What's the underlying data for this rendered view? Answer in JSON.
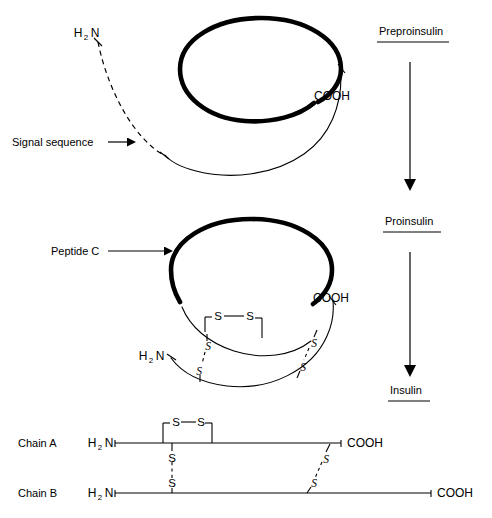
{
  "figure": {
    "background_color": "#ffffff",
    "line_color": "#000000",
    "width": 492,
    "height": 518
  },
  "stages": [
    {
      "id": "preproinsulin",
      "label": "Preproinsulin"
    },
    {
      "id": "proinsulin",
      "label": "Proinsulin"
    },
    {
      "id": "insulin",
      "label": "Insulin"
    }
  ],
  "panel_preproinsulin": {
    "amino_terminus": {
      "text": "H",
      "subscript": "2",
      "text2": "N"
    },
    "carboxyl_terminus": "COOH",
    "callout": "Signal sequence"
  },
  "panel_proinsulin": {
    "amino_terminus": {
      "text": "H",
      "subscript": "2",
      "text2": "N"
    },
    "carboxyl_terminus": "COOH",
    "callout": "Peptide C",
    "disulfide_label": "S",
    "disulfide_bridges": [
      {
        "id": "intra-a-chain",
        "atoms": [
          "S",
          "S"
        ]
      },
      {
        "id": "inter-left",
        "atoms": [
          "S",
          "S"
        ]
      },
      {
        "id": "inter-right",
        "atoms": [
          "S",
          "S"
        ]
      }
    ]
  },
  "panel_insulin": {
    "chains": [
      {
        "id": "chain-a",
        "label": "Chain A",
        "amino_terminus": {
          "text": "H",
          "subscript": "2",
          "text2": "N"
        },
        "carboxyl_terminus": "COOH"
      },
      {
        "id": "chain-b",
        "label": "Chain B",
        "amino_terminus": {
          "text": "H",
          "subscript": "2",
          "text2": "N"
        },
        "carboxyl_terminus": "COOH"
      }
    ],
    "disulfide_label": "S",
    "disulfide_bridges": [
      {
        "id": "intra-a-chain",
        "atoms": [
          "S",
          "S"
        ]
      },
      {
        "id": "inter-left",
        "atoms": [
          "S",
          "S"
        ]
      },
      {
        "id": "inter-right",
        "atoms": [
          "S",
          "S"
        ]
      }
    ]
  },
  "icons": {
    "arrow_down": "arrow-down-icon",
    "arrow_right": "arrow-right-icon"
  }
}
